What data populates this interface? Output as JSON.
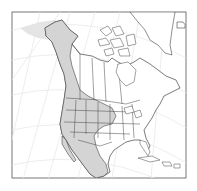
{
  "map": {
    "region": "North America",
    "type": "species range map",
    "colors": {
      "background": "#ffffff",
      "frame": "#555555",
      "graticule": "#e6e6e6",
      "land": "#ffffff",
      "range_fill": "#d4d4d4",
      "outline": "#444444"
    },
    "legend": []
  }
}
